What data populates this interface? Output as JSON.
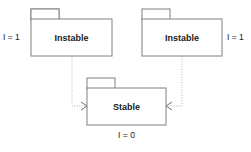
{
  "diagram": {
    "type": "uml-package-diagram",
    "background_color": "#ffffff",
    "border_color": "#808080",
    "text_color": "#1a1a1a",
    "connector_color": "#b0b0b0",
    "arrow_color": "#707070",
    "packages": [
      {
        "id": "instable-left",
        "name": "Instable",
        "metric": "I = 1",
        "metric_position": "left",
        "box": {
          "x": 31,
          "y": 19,
          "width": 81,
          "height": 37
        },
        "tab": {
          "x": 31,
          "y": 9,
          "width": 28,
          "height": 10
        },
        "metric_anchor": {
          "x": 3,
          "y": 37
        }
      },
      {
        "id": "instable-right",
        "name": "Instable",
        "metric": "I = 1",
        "metric_position": "right",
        "box": {
          "x": 142,
          "y": 19,
          "width": 80,
          "height": 37
        },
        "tab": {
          "x": 142,
          "y": 9,
          "width": 28,
          "height": 10
        },
        "metric_anchor": {
          "x": 227,
          "y": 37
        }
      },
      {
        "id": "stable-center",
        "name": "Stable",
        "metric": "I = 0",
        "metric_position": "below",
        "box": {
          "x": 87,
          "y": 88,
          "width": 79,
          "height": 37
        },
        "tab": {
          "x": 87,
          "y": 78,
          "width": 28,
          "height": 10
        },
        "metric_anchor": {
          "x": 126,
          "y": 136
        }
      }
    ],
    "dependencies": [
      {
        "id": "dep-left-to-stable",
        "from": "instable-left",
        "to": "stable-center",
        "style": "dotted",
        "arrowhead": "open",
        "path": "M 72 56 L 72 106 L 87 106",
        "arrow_path": "M 81 102 L 87 106 L 81 110"
      },
      {
        "id": "dep-right-to-stable",
        "from": "instable-right",
        "to": "stable-center",
        "style": "dotted",
        "arrowhead": "open",
        "path": "M 182 56 L 182 106 L 166 106",
        "arrow_path": "M 172 102 L 166 106 L 172 110"
      }
    ]
  }
}
